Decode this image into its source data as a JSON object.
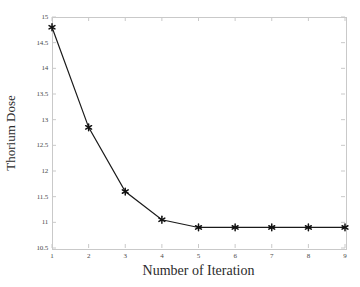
{
  "chart_data": {
    "type": "line",
    "title": "",
    "xlabel": "Number of Iteration",
    "ylabel": "Thorium Dose",
    "x": [
      1,
      2,
      3,
      4,
      5,
      6,
      7,
      8,
      9
    ],
    "values": [
      14.8,
      12.85,
      11.6,
      11.05,
      10.9,
      10.9,
      10.9,
      10.9,
      10.9
    ],
    "series": [
      {
        "name": "Thorium Dose",
        "values": [
          14.8,
          12.85,
          11.6,
          11.05,
          10.9,
          10.9,
          10.9,
          10.9,
          10.9
        ]
      }
    ],
    "xlim": [
      1,
      9
    ],
    "ylim": [
      10.5,
      15
    ],
    "xticks": [
      "1",
      "2",
      "3",
      "4",
      "5",
      "6",
      "7",
      "8",
      "9"
    ],
    "yticks": [
      "10.5",
      "11",
      "11.5",
      "12",
      "12.5",
      "13",
      "13.5",
      "14",
      "14.5",
      "15"
    ],
    "ytick_values": [
      10.5,
      11,
      11.5,
      12,
      12.5,
      13,
      13.5,
      14,
      14.5,
      15
    ],
    "grid": false,
    "legend": null,
    "marker": "asterisk",
    "line_color": "#1a1a1a",
    "marker_color": "#111111",
    "axis_color": "#c9c9c9",
    "background": "#ffffff"
  }
}
